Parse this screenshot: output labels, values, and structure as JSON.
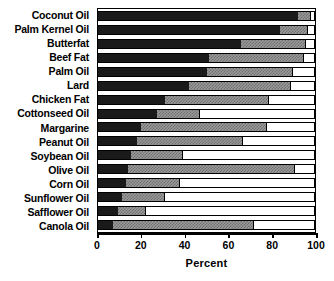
{
  "chart_data": {
    "type": "bar",
    "orientation": "horizontal",
    "stacked": true,
    "title": "",
    "xlabel": "Percent",
    "ylabel": "",
    "xlim": [
      0,
      100
    ],
    "xticks": [
      0,
      20,
      40,
      60,
      80,
      100
    ],
    "xticklabels": [
      "0",
      "20",
      "40",
      "60",
      "80",
      "100"
    ],
    "grid": false,
    "legend": "none",
    "categories": [
      "Coconut Oil",
      "Palm Kernel Oil",
      "Butterfat",
      "Beef Fat",
      "Palm Oil",
      "Lard",
      "Chicken Fat",
      "Cottonseed Oil",
      "Margarine",
      "Peanut Oil",
      "Soybean Oil",
      "Olive Oil",
      "Corn Oil",
      "Sunflower Oil",
      "Safflower Oil",
      "Canola Oil"
    ],
    "series": [
      {
        "name": "Saturated Fat",
        "fill": "solid-black",
        "color": "#1a1a1a",
        "values": [
          92,
          84,
          66,
          51,
          50,
          42,
          31,
          27,
          20,
          18,
          15,
          14,
          13,
          11,
          9,
          7
        ]
      },
      {
        "name": "Monounsaturated Fat",
        "fill": "checkered-gray",
        "color": "#9a9a9a",
        "values": [
          6,
          13,
          30,
          44,
          40,
          47,
          48,
          20,
          58,
          49,
          24,
          77,
          25,
          20,
          13,
          65
        ]
      },
      {
        "name": "Polyunsaturated Fat",
        "fill": "white",
        "color": "#ffffff",
        "values": [
          2,
          3,
          4,
          5,
          10,
          11,
          21,
          53,
          22,
          33,
          61,
          9,
          62,
          69,
          78,
          28
        ]
      }
    ]
  },
  "axis": {
    "x_title": "Percent"
  }
}
